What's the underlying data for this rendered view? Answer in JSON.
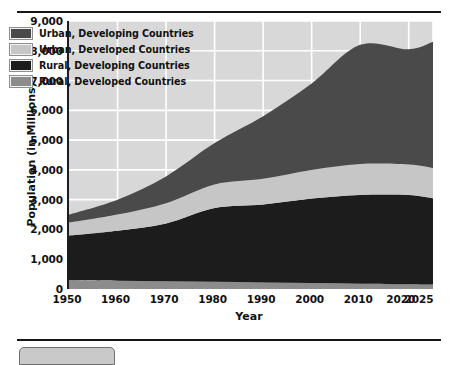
{
  "chart_data": {
    "type": "area",
    "title": "",
    "subtitle": "",
    "xlabel": "Year",
    "ylabel": "Population (in Millions)",
    "stacked": true,
    "grid": true,
    "grid_color": "#ffffff",
    "plot_background": "#d8d8d8",
    "legend_position": "top-left",
    "xlim": [
      1950,
      2025
    ],
    "ylim": [
      0,
      9000
    ],
    "ytick_step": 1000,
    "x_tick_labels": [
      "1950",
      "1960",
      "1970",
      "1980",
      "1990",
      "2000",
      "2010",
      "2020",
      "2025"
    ],
    "x_ticks": [
      1950,
      1960,
      1970,
      1980,
      1990,
      2000,
      2010,
      2020,
      2025
    ],
    "y_tick_labels": [
      "0",
      "1,000",
      "2,000",
      "3,000",
      "4,000",
      "5,000",
      "6,000",
      "7,000",
      "8,000",
      "9,000"
    ],
    "y_ticks": [
      0,
      1000,
      2000,
      3000,
      4000,
      5000,
      6000,
      7000,
      8000,
      9000
    ],
    "x": [
      1950,
      1960,
      1970,
      1980,
      1990,
      2000,
      2010,
      2020,
      2025
    ],
    "stack_order_bottom_to_top": [
      "Rural, Developed Countries",
      "Rural, Developing Countries",
      "Urban, Developed Countries",
      "Urban, Developing Countries"
    ],
    "series": [
      {
        "name": "Rural, Developed Countries",
        "color": "#8c8c8c",
        "values": [
          300,
          280,
          260,
          240,
          220,
          200,
          180,
          160,
          150
        ]
      },
      {
        "name": "Rural, Developing Countries",
        "color": "#1c1c1c",
        "values": [
          1500,
          1680,
          1940,
          2480,
          2620,
          2840,
          2980,
          3000,
          2900
        ]
      },
      {
        "name": "Urban, Developed Countries",
        "color": "#c6c6c6",
        "values": [
          430,
          540,
          680,
          790,
          860,
          960,
          1040,
          1020,
          1010
        ]
      },
      {
        "name": "Urban, Developing Countries",
        "color": "#4a4a4a",
        "values": [
          270,
          500,
          900,
          1390,
          2100,
          2900,
          4000,
          3870,
          4240
        ]
      }
    ],
    "cumulative_totals": [
      2500,
      3000,
      3780,
      4900,
      5800,
      6900,
      8200,
      8050,
      8300
    ],
    "annotations": []
  },
  "legend": {
    "items": [
      {
        "label": "Urban, Developing Countries",
        "color": "#4a4a4a"
      },
      {
        "label": "Urban, Developed Countries",
        "color": "#c6c6c6"
      },
      {
        "label": "Rural, Developing Countries",
        "color": "#1c1c1c"
      },
      {
        "label": "Rural, Developed Countries",
        "color": "#8c8c8c"
      }
    ]
  }
}
